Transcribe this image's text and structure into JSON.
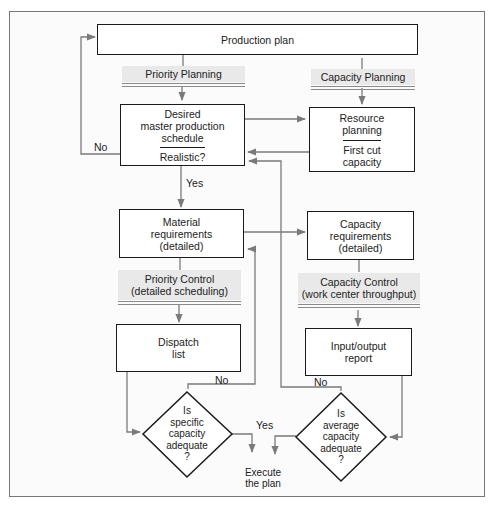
{
  "diagram": {
    "production_plan": "Production plan",
    "bands": {
      "priority_planning": [
        "Priority Planning"
      ],
      "capacity_planning": [
        "Capacity Planning"
      ],
      "priority_control": [
        "Priority Control",
        "(detailed scheduling)"
      ],
      "capacity_control": [
        "Capacity Control",
        "(work center throughput)"
      ]
    },
    "boxes": {
      "mps": [
        "Desired",
        "master production",
        "schedule"
      ],
      "mps_check": "Realistic?",
      "resource_planning": [
        "Resource",
        "planning"
      ],
      "first_cut": [
        "First cut",
        "capacity"
      ],
      "material_req": [
        "Material",
        "requirements",
        "(detailed)"
      ],
      "capacity_req": [
        "Capacity",
        "requirements",
        "(detailed)"
      ],
      "dispatch": [
        "Dispatch",
        "list"
      ],
      "io_report": [
        "Input/output",
        "report"
      ]
    },
    "decisions": {
      "specific": [
        "Is",
        "specific",
        "capacity",
        "adequate",
        "?"
      ],
      "average": [
        "Is",
        "average",
        "capacity",
        "adequate",
        "?"
      ]
    },
    "terminal": [
      "Execute",
      "the plan"
    ],
    "edge_labels": {
      "no_left": "No",
      "yes_mid": "Yes",
      "no_specific": "No",
      "no_average": "No",
      "yes_bottom": "Yes"
    },
    "colors": {
      "box_border": "#1a1a1a",
      "connector": "#7a7a7a",
      "band_fill": "#e9e9e9"
    }
  }
}
